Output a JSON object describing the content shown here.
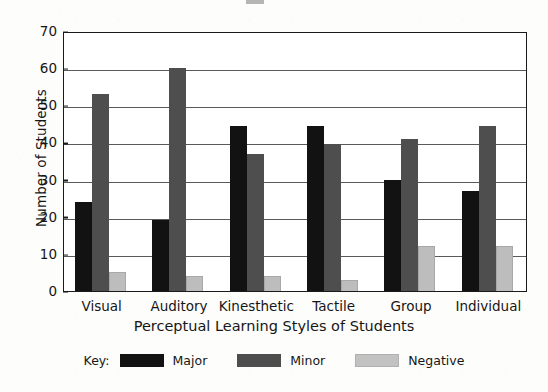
{
  "chart_data": {
    "type": "bar",
    "title": "",
    "xlabel": "Perceptual Learning Styles of Students",
    "ylabel": "Number of Students",
    "categories": [
      "Visual",
      "Auditory",
      "Kinesthetic",
      "Tactile",
      "Group",
      "Individual"
    ],
    "series": [
      {
        "name": "Major",
        "color": "#121212",
        "values": [
          24,
          19,
          44.5,
          44.5,
          30,
          27
        ]
      },
      {
        "name": "Minor",
        "color": "#4e4e4e",
        "values": [
          53,
          60,
          37,
          39.5,
          41,
          44.5
        ]
      },
      {
        "name": "Negative",
        "color": "#c2c2c2",
        "values": [
          5,
          4,
          4,
          3,
          12,
          12
        ]
      }
    ],
    "ylim": [
      0,
      70
    ],
    "yticks": [
      0,
      10,
      20,
      30,
      40,
      50,
      60,
      70
    ],
    "ytick_labels": [
      "0",
      "10",
      "20",
      "30",
      "40",
      "50",
      "60",
      "70"
    ],
    "grid": true,
    "legend_position": "bottom",
    "legend_prefix": "Key:"
  }
}
